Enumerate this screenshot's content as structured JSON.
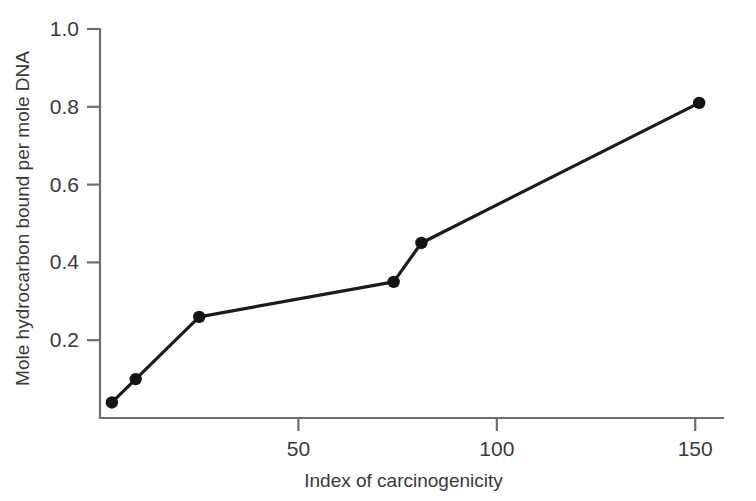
{
  "chart_data": {
    "type": "line",
    "title": "",
    "subtitle": "",
    "xlabel": "Index of carcinogenicity",
    "ylabel": "Mole hydrocarbon bound per mole DNA",
    "xlim": [
      0,
      157
    ],
    "ylim": [
      0,
      1.0
    ],
    "xticks": [
      50,
      100,
      150
    ],
    "xtick_labels": [
      "50",
      "100",
      "150"
    ],
    "yticks": [
      0.2,
      0.4,
      0.6,
      0.8,
      1.0
    ],
    "ytick_labels": [
      "0.2",
      "0.4",
      "0.6",
      "0.8",
      "1.0"
    ],
    "grid": false,
    "legend": false,
    "legend_position": "none",
    "marker": "filled-circle",
    "series": [
      {
        "name": "hydrocarbon binding",
        "x": [
          3,
          9,
          25,
          74,
          81,
          151
        ],
        "y": [
          0.04,
          0.1,
          0.26,
          0.35,
          0.45,
          0.81
        ]
      }
    ],
    "colors": {
      "line": "#1b1b1b",
      "marker": "#141414",
      "axis": "#6e6e6e",
      "text": "#3a3a3a",
      "background": "#ffffff"
    }
  },
  "figure": {
    "width": 756,
    "height": 501,
    "plot_area": {
      "left": 100,
      "right": 723,
      "top": 29,
      "bottom": 418
    }
  }
}
